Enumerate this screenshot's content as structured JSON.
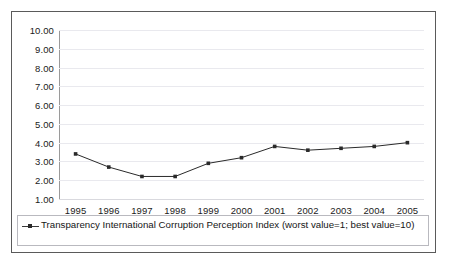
{
  "chart_data": {
    "type": "line",
    "title": "",
    "xlabel": "",
    "ylabel": "",
    "ylim": [
      1.0,
      10.0
    ],
    "ytick_labels": [
      "10.00",
      "9.00",
      "8.00",
      "7.00",
      "6.00",
      "5.00",
      "4.00",
      "3.00",
      "2.00",
      "1.00"
    ],
    "yticks": [
      10.0,
      9.0,
      8.0,
      7.0,
      6.0,
      5.0,
      4.0,
      3.0,
      2.0,
      1.0
    ],
    "grid": true,
    "legend_position": "bottom",
    "categories": [
      "1995",
      "1996",
      "1997",
      "1998",
      "1999",
      "2000",
      "2001",
      "2002",
      "2003",
      "2004",
      "2005"
    ],
    "x": [
      1995,
      1996,
      1997,
      1998,
      1999,
      2000,
      2001,
      2002,
      2003,
      2004,
      2005
    ],
    "series": [
      {
        "name": "Transparency International Corruption Perception Index (worst value=1; best value=10)",
        "values": [
          3.4,
          2.7,
          2.2,
          2.2,
          2.9,
          3.2,
          3.8,
          3.6,
          3.7,
          3.8,
          4.0
        ],
        "color": "#2a2a2a",
        "marker": "square"
      }
    ]
  },
  "legend": {
    "entries": [
      {
        "label": "Transparency International Corruption Perception Index (worst value=1; best value=10)"
      }
    ]
  },
  "colors": {
    "series_line": "#2a2a2a",
    "grid": "#e9e9ee",
    "axis": "#9a9a9a",
    "frame": "#5a5a5a",
    "text": "#151515"
  }
}
